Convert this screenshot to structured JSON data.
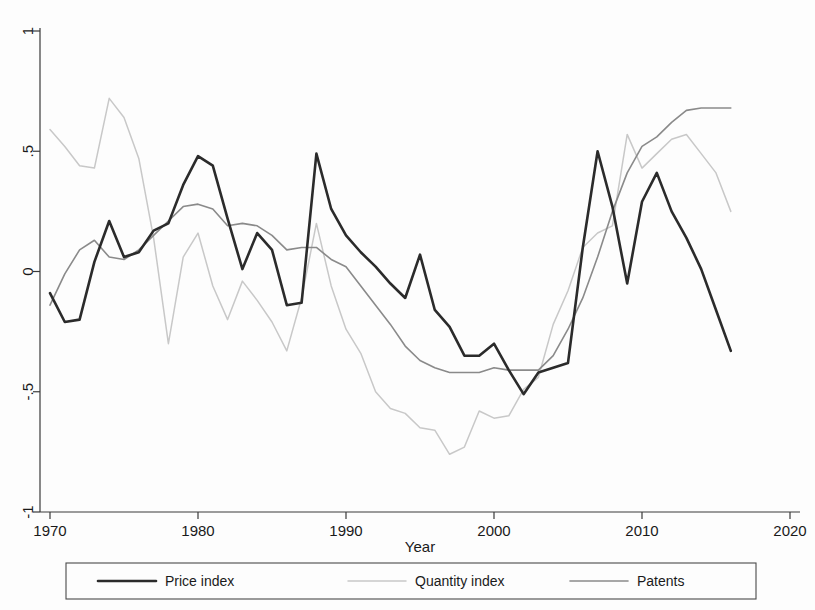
{
  "chart_data": {
    "type": "line",
    "title": "",
    "subtitle": "",
    "xlabel": "Year",
    "ylabel": "",
    "xlim": [
      1967.5,
      2020
    ],
    "ylim": [
      -1,
      1
    ],
    "grid": false,
    "legend_position": "bottom",
    "xticks": [
      1970,
      1980,
      1990,
      2000,
      2010,
      2020
    ],
    "xtick_labels": [
      "1970",
      "1980",
      "1990",
      "2000",
      "2010",
      "2020"
    ],
    "yticks": [
      -1,
      -0.5,
      0,
      0.5,
      1
    ],
    "ytick_labels": [
      "-1",
      "-.5",
      "0",
      ".5",
      "1"
    ],
    "x": [
      1970,
      1971,
      1972,
      1973,
      1974,
      1975,
      1976,
      1977,
      1978,
      1979,
      1980,
      1981,
      1982,
      1983,
      1984,
      1985,
      1986,
      1987,
      1988,
      1989,
      1990,
      1991,
      1992,
      1993,
      1994,
      1995,
      1996,
      1997,
      1998,
      1999,
      2000,
      2001,
      2002,
      2003,
      2004,
      2005,
      2006,
      2007,
      2008,
      2009,
      2010,
      2011,
      2012,
      2013,
      2014,
      2015,
      2016
    ],
    "series": [
      {
        "name": "Price index",
        "color": "#2b2b2b",
        "width": 2.6,
        "values": [
          -0.09,
          -0.21,
          -0.2,
          0.04,
          0.21,
          0.06,
          0.08,
          0.17,
          0.2,
          0.36,
          0.48,
          0.44,
          0.22,
          0.01,
          0.16,
          0.09,
          -0.14,
          -0.13,
          0.49,
          0.26,
          0.15,
          0.08,
          0.02,
          -0.05,
          -0.11,
          0.07,
          -0.16,
          -0.23,
          -0.35,
          -0.35,
          -0.3,
          -0.41,
          -0.51,
          -0.42,
          -0.4,
          -0.38,
          0.1,
          0.5,
          0.27,
          -0.05,
          0.29,
          0.41,
          0.25,
          0.14,
          0.01,
          -0.16,
          -0.33
        ]
      },
      {
        "name": "Quantity index",
        "color": "#c8c8c8",
        "width": 1.5,
        "values": [
          0.59,
          0.52,
          0.44,
          0.43,
          0.72,
          0.64,
          0.47,
          0.14,
          -0.3,
          0.06,
          0.16,
          -0.06,
          -0.2,
          -0.04,
          -0.12,
          -0.21,
          -0.33,
          -0.11,
          0.2,
          -0.06,
          -0.24,
          -0.34,
          -0.5,
          -0.57,
          -0.59,
          -0.65,
          -0.66,
          -0.76,
          -0.73,
          -0.58,
          -0.61,
          -0.6,
          -0.49,
          -0.44,
          -0.22,
          -0.08,
          0.1,
          0.16,
          0.19,
          0.57,
          0.43,
          0.49,
          0.55,
          0.57,
          0.49,
          0.41,
          0.25
        ]
      },
      {
        "name": "Patents",
        "color": "#8a8a8a",
        "width": 1.6,
        "values": [
          -0.14,
          -0.01,
          0.09,
          0.13,
          0.06,
          0.05,
          0.09,
          0.15,
          0.21,
          0.27,
          0.28,
          0.26,
          0.19,
          0.2,
          0.19,
          0.15,
          0.09,
          0.1,
          0.1,
          0.05,
          0.02,
          -0.06,
          -0.14,
          -0.22,
          -0.31,
          -0.37,
          -0.4,
          -0.42,
          -0.42,
          -0.42,
          -0.4,
          -0.41,
          -0.41,
          -0.41,
          -0.35,
          -0.24,
          -0.11,
          0.06,
          0.25,
          0.41,
          0.52,
          0.56,
          0.62,
          0.67,
          0.68,
          0.68,
          0.68
        ]
      }
    ]
  },
  "legend": {
    "items": [
      {
        "label": "Price index",
        "color": "#2b2b2b",
        "width": 2.6
      },
      {
        "label": "Quantity index",
        "color": "#c8c8c8",
        "width": 1.5
      },
      {
        "label": "Patents",
        "color": "#8a8a8a",
        "width": 1.6
      }
    ]
  },
  "axes": {
    "x_title": "Year",
    "y_title": ""
  }
}
